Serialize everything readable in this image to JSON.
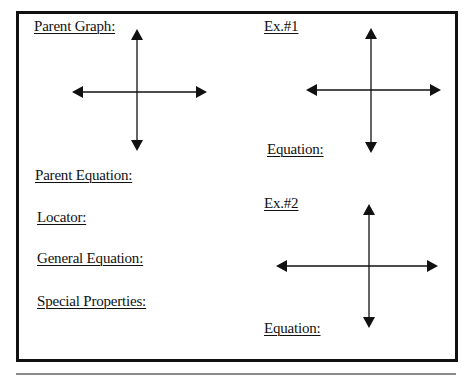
{
  "worksheet": {
    "left_column": {
      "parent_graph_label": "Parent Graph:",
      "parent_equation_label": "Parent Equation:",
      "locator_label": "Locator:",
      "general_equation_label": "General Equation:",
      "special_properties_label": "Special Properties:"
    },
    "right_column": {
      "example_1": {
        "title": "Ex.#1",
        "equation_label": "Equation:"
      },
      "example_2": {
        "title": "Ex.#2",
        "equation_label": "Equation:"
      }
    },
    "graphs": [
      {
        "name": "parent-graph",
        "icon": "coordinate-axes-icon",
        "center_x": 137,
        "center_y": 92,
        "x_min": 72,
        "x_max": 207,
        "y_min": 29,
        "y_max": 151
      },
      {
        "name": "example-1-graph",
        "icon": "coordinate-axes-icon",
        "center_x": 371,
        "center_y": 90,
        "x_min": 306,
        "x_max": 441,
        "y_min": 28,
        "y_max": 153
      },
      {
        "name": "example-2-graph",
        "icon": "coordinate-axes-icon",
        "center_x": 369,
        "center_y": 266,
        "x_min": 276,
        "x_max": 438,
        "y_min": 204,
        "y_max": 328
      }
    ],
    "colors": {
      "ink": "#111111",
      "border": "#111111",
      "rule": "#8a8a8a",
      "background": "#ffffff"
    }
  }
}
